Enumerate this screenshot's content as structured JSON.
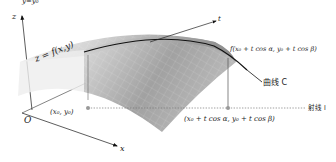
{
  "figure": {
    "top_clipped_text": "y=y₀",
    "axes": {
      "z_label": "z",
      "x_label": "x",
      "origin_label": "O"
    },
    "surface_label": "z = f(x,y)",
    "tangent_label": "t",
    "point_on_curve_label": "f(x₀ + t cos α, y₀ + t cos β)",
    "curve_label": "曲线 C",
    "ray_label": "射线 l",
    "base_point_label": "(x₀, y₀)",
    "moved_point_label": "(x₀ + t cos α, y₀ + t cos β)",
    "colors": {
      "surface_light": "#e6e6e6",
      "surface_dark": "#9a9a9a",
      "curve": "#111111",
      "axis": "#333333",
      "dotted_ray": "#777777",
      "point": "#888888"
    }
  }
}
